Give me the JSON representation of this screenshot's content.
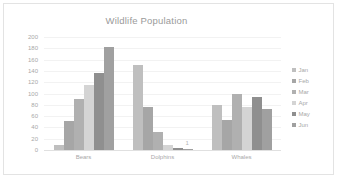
{
  "chart_data": {
    "type": "bar",
    "title": "Wildlife Population",
    "xlabel": "",
    "ylabel": "",
    "ylim": [
      0,
      200
    ],
    "ytick_step": 20,
    "yticks": [
      200,
      180,
      160,
      140,
      120,
      100,
      80,
      60,
      40,
      20,
      0
    ],
    "grid": true,
    "legend_position": "right",
    "categories": [
      "Bears",
      "Dolphins",
      "Whales"
    ],
    "series": [
      {
        "name": "Jan",
        "color": "#bfbfbf",
        "values": [
          8,
          150,
          80
        ]
      },
      {
        "name": "Feb",
        "color": "#a6a6a6",
        "values": [
          52,
          77,
          53
        ]
      },
      {
        "name": "Mar",
        "color": "#b0b0b0",
        "values": [
          91,
          32,
          100
        ]
      },
      {
        "name": "Apr",
        "color": "#d4d4d4",
        "values": [
          115,
          8,
          76
        ]
      },
      {
        "name": "May",
        "color": "#8f8f8f",
        "values": [
          136,
          4,
          93
        ]
      },
      {
        "name": "Jun",
        "color": "#a0a0a0",
        "values": [
          183,
          1,
          73
        ]
      }
    ],
    "annotations": [
      {
        "text": "1",
        "series": "Jun",
        "category": "Dolphins",
        "value": 1
      }
    ]
  },
  "colors": {
    "title_text": "#9a9a9a",
    "axis_text": "#a8a8a8",
    "gridline": "#f2f2f2",
    "baseline": "#e0e0e0",
    "frame_border": "#e3e3e3",
    "background": "#ffffff"
  }
}
